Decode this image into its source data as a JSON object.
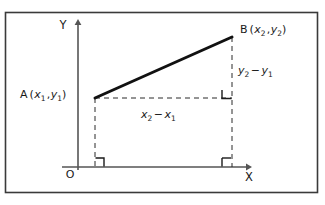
{
  "figure": {
    "frame": {
      "border_color": "#3a3a3a",
      "background": "#ffffff",
      "x": 5,
      "y": 12,
      "width": 313,
      "height": 181
    },
    "axes": {
      "color": "#555555",
      "origin_label": "O",
      "x_axis_label": "X",
      "y_axis_label": "Y",
      "x_axis": {
        "x1": 62,
        "y1": 167,
        "x2": 248,
        "y2": 167
      },
      "y_axis": {
        "x1": 78,
        "y1": 170,
        "x2": 78,
        "y2": 22
      }
    },
    "segment": {
      "color": "#111111",
      "stroke_width": 3,
      "from": {
        "x": 95,
        "y": 98
      },
      "to": {
        "x": 232,
        "y": 37
      }
    },
    "dashed": {
      "color": "#2b2b2b",
      "stroke_width": 1,
      "dash_pattern": "5 4"
    },
    "points": [
      {
        "name": "A",
        "label_main": "A",
        "label_open": "(",
        "var1": "x",
        "sub1": "1",
        "comma": ",",
        "var2": "y",
        "sub2": "1",
        "label_close": ")",
        "x": 95,
        "y": 98
      },
      {
        "name": "B",
        "label_main": "B",
        "label_open": "(",
        "var1": "x",
        "sub1": "2",
        "comma": ",",
        "var2": "y",
        "sub2": "2",
        "label_close": ")",
        "x": 232,
        "y": 37
      }
    ],
    "annotations": {
      "horizontal": {
        "var_a": "x",
        "sub_a": "2",
        "minus": "−",
        "var_b": "x",
        "sub_b": "1",
        "x": 145,
        "y": 116
      },
      "vertical": {
        "var_a": "y",
        "sub_a": "2",
        "minus": "−",
        "var_b": "y",
        "sub_b": "1",
        "x": 240,
        "y": 71
      }
    },
    "right_angle_markers": [
      {
        "name": "corner-b-foot",
        "x": 232,
        "y": 98
      },
      {
        "name": "axis-foot-a",
        "x": 95,
        "y": 167
      },
      {
        "name": "axis-foot-b",
        "x": 232,
        "y": 167
      }
    ]
  }
}
